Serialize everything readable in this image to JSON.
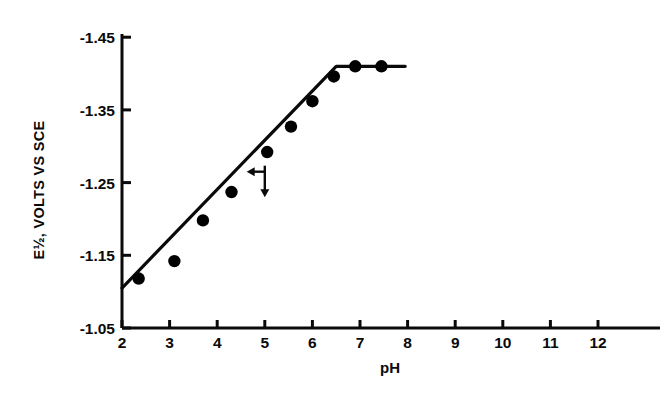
{
  "chart_data": {
    "type": "line",
    "title": "",
    "subtitle": "",
    "xlabel": "pH",
    "ylabel": "E½, VOLTS VS SCE",
    "xlim": [
      2,
      12.6
    ],
    "ylim": [
      -1.05,
      -1.45
    ],
    "y_axis_inverted": true,
    "grid": false,
    "legend": null,
    "x_ticks": [
      "2",
      "3",
      "4",
      "5",
      "6",
      "7",
      "8",
      "9",
      "10",
      "11",
      "12"
    ],
    "x_tick_values": [
      2,
      3,
      4,
      5,
      6,
      7,
      8,
      9,
      10,
      11,
      12
    ],
    "y_ticks": [
      "-1.05",
      "-1.15",
      "-1.25",
      "-1.35",
      "-1.45"
    ],
    "y_tick_values": [
      -1.05,
      -1.15,
      -1.25,
      -1.35,
      -1.45
    ],
    "series": [
      {
        "name": "E½ vs pH",
        "marker": "filled-circle",
        "color": "#000000",
        "x": [
          2.35,
          3.1,
          3.7,
          4.3,
          5.05,
          5.55,
          6.0,
          6.45,
          6.9,
          7.45
        ],
        "y": [
          -1.118,
          -1.142,
          -1.198,
          -1.237,
          -1.292,
          -1.327,
          -1.362,
          -1.396,
          -1.41,
          -1.41
        ]
      }
    ],
    "line_path": {
      "x": [
        2.0,
        6.5,
        7.95
      ],
      "y": [
        -1.105,
        -1.41,
        -1.41
      ],
      "description": "linear rise from pH 2 to pH 6.5 then horizontal plateau"
    },
    "annotations": [
      {
        "name": "pka-marker",
        "type": "crossed-arrows",
        "x": 5.0,
        "y": -1.265,
        "arrow_left_to": 4.62,
        "arrow_down_to": -1.23,
        "label": ""
      }
    ]
  },
  "axis": {
    "x_title": "pH",
    "y_title": "E½, VOLTS VS SCE"
  }
}
